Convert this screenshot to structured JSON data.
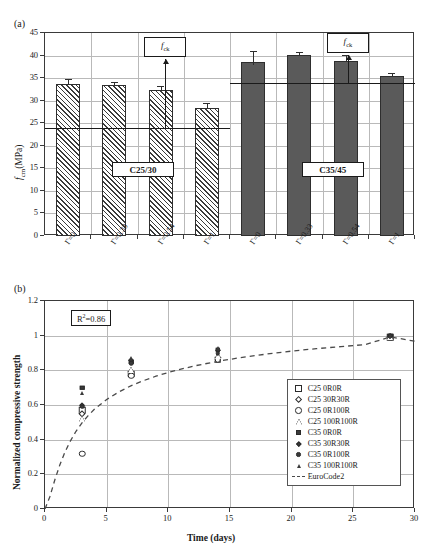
{
  "panel_a": {
    "label": "(a)",
    "ylabel": "f_cm(MPa)",
    "ylabel_main": "f",
    "ylabel_sub": "cm",
    "ylabel_unit": "(MPa)",
    "yticks": [
      0,
      5,
      10,
      15,
      20,
      25,
      30,
      35,
      40,
      45
    ],
    "ylim": [
      0,
      45
    ],
    "group_tags": [
      "C25/30",
      "C35/45"
    ],
    "fck_label": "f",
    "fck_sub": "ck",
    "fck_values": [
      24,
      34
    ],
    "categories": [
      "Γ=0",
      "Γ=0.33",
      "Γ=0.54",
      "Γ=1",
      "Γ=0",
      "Γ=0.33",
      "Γ=0.54",
      "Γ=1"
    ],
    "chart_data": {
      "type": "bar",
      "title": "",
      "xlabel": "",
      "ylabel": "f_cm (MPa)",
      "ylim": [
        0,
        45
      ],
      "grid": true,
      "categories": [
        "Γ=0",
        "Γ=0.33",
        "Γ=0.54",
        "Γ=1",
        "Γ=0",
        "Γ=0.33",
        "Γ=0.54",
        "Γ=1"
      ],
      "series": [
        {
          "name": "C25/30",
          "fill": "hatched",
          "values": [
            33.8,
            33.5,
            32.3,
            28.4
          ],
          "errors": [
            1.1,
            0.7,
            0.9,
            1.0
          ]
        },
        {
          "name": "C35/45",
          "fill": "solid-grey",
          "values": [
            38.5,
            40.1,
            38.9,
            35.4
          ],
          "errors": [
            2.6,
            0.7,
            1.2,
            0.8
          ]
        }
      ],
      "reference_lines": [
        {
          "label": "f_ck",
          "value": 24,
          "group": "C25/30"
        },
        {
          "label": "f_ck",
          "value": 34,
          "group": "C35/45"
        }
      ]
    }
  },
  "panel_b": {
    "label": "(b)",
    "ylabel": "Normalized compressive strength",
    "xlabel": "Time (days)",
    "r2_prefix": "R",
    "r2_sup": "2",
    "r2_value": "=0.86",
    "r2_text": "R²=0.86",
    "xticks": [
      0,
      5,
      10,
      15,
      20,
      25,
      30
    ],
    "yticks": [
      "0",
      "0.2",
      "0.4",
      "0.6",
      "0.8",
      "1",
      "1.2"
    ],
    "legend": [
      {
        "label": "C25 0R0R",
        "symbol": "square-open"
      },
      {
        "label": "C25 30R30R",
        "symbol": "diamond-open"
      },
      {
        "label": "C25 0R100R",
        "symbol": "circle-open"
      },
      {
        "label": "C25 100R100R",
        "symbol": "triangle-open"
      },
      {
        "label": "C35 0R0R",
        "symbol": "square-filled"
      },
      {
        "label": "C35 30R30R",
        "symbol": "diamond-filled"
      },
      {
        "label": "C35 0R100R",
        "symbol": "circle-filled"
      },
      {
        "label": "C35 100R100R",
        "symbol": "triangle-filled"
      },
      {
        "label": "EuroCode2",
        "symbol": "dashed-line"
      }
    ],
    "chart_data": {
      "type": "scatter",
      "title": "",
      "xlabel": "Time (days)",
      "ylabel": "Normalized compressive strength",
      "xlim": [
        0,
        30
      ],
      "ylim": [
        0,
        1.2
      ],
      "grid": true,
      "legend_position": "bottom-right",
      "annotations": [
        {
          "text": "R²=0.86",
          "x": 4.5,
          "y": 1.1
        }
      ],
      "series": [
        {
          "name": "C25 0R0R",
          "symbol": "square-open",
          "x": [
            3,
            7,
            14,
            28
          ],
          "y": [
            0.57,
            0.78,
            0.86,
            0.99
          ]
        },
        {
          "name": "C25 30R30R",
          "symbol": "diamond-open",
          "x": [
            3,
            7,
            14,
            28
          ],
          "y": [
            0.55,
            0.79,
            0.87,
            0.99
          ]
        },
        {
          "name": "C25 0R100R",
          "symbol": "circle-open",
          "x": [
            3,
            7,
            14,
            28
          ],
          "y": [
            0.32,
            0.77,
            0.86,
            0.99
          ]
        },
        {
          "name": "C25 100R100R",
          "symbol": "triangle-open",
          "x": [
            3,
            7,
            14,
            28
          ],
          "y": [
            0.52,
            0.8,
            0.88,
            0.99
          ]
        },
        {
          "name": "C35 0R0R",
          "symbol": "square-filled",
          "x": [
            3,
            7,
            14,
            28
          ],
          "y": [
            0.7,
            0.85,
            0.92,
            1.0
          ]
        },
        {
          "name": "C35 30R30R",
          "symbol": "diamond-filled",
          "x": [
            3,
            7,
            14,
            28
          ],
          "y": [
            0.6,
            0.86,
            0.92,
            1.0
          ]
        },
        {
          "name": "C35 0R100R",
          "symbol": "circle-filled",
          "x": [
            3,
            7,
            14,
            28
          ],
          "y": [
            0.59,
            0.84,
            0.9,
            1.0
          ]
        },
        {
          "name": "C35 100R100R",
          "symbol": "triangle-filled",
          "x": [
            3,
            7,
            14,
            28
          ],
          "y": [
            0.67,
            0.87,
            0.93,
            1.0
          ]
        }
      ],
      "fit_curve": {
        "name": "EuroCode2",
        "style": "dashed",
        "x": [
          0,
          0.4,
          0.8,
          1.2,
          1.6,
          2,
          2.5,
          3,
          3.5,
          4,
          5,
          6,
          7,
          8,
          9,
          10,
          12,
          14,
          16,
          18,
          20,
          22,
          24,
          26,
          28,
          30
        ],
        "y": [
          0.0,
          0.072,
          0.169,
          0.254,
          0.325,
          0.385,
          0.447,
          0.497,
          0.539,
          0.575,
          0.632,
          0.676,
          0.712,
          0.741,
          0.766,
          0.788,
          0.824,
          0.852,
          0.875,
          0.894,
          0.911,
          0.925,
          0.937,
          0.949,
          0.993,
          0.968
        ]
      }
    }
  }
}
